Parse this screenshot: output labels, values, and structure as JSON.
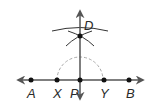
{
  "diagram": {
    "type": "perpendicular-line-construction",
    "colors": {
      "line": "#555555",
      "point": "#111111",
      "dashed_arc": "#aaaaaa",
      "label": "#2a2a2a"
    },
    "points": [
      {
        "id": "A",
        "label": "A",
        "x": 31,
        "y": 80
      },
      {
        "id": "X",
        "label": "X",
        "x": 57,
        "y": 80
      },
      {
        "id": "P",
        "label": "P",
        "x": 80,
        "y": 80
      },
      {
        "id": "Y",
        "label": "Y",
        "x": 104,
        "y": 80
      },
      {
        "id": "B",
        "label": "B",
        "x": 129,
        "y": 80
      },
      {
        "id": "D",
        "label": "D",
        "x": 80,
        "y": 36
      }
    ]
  }
}
